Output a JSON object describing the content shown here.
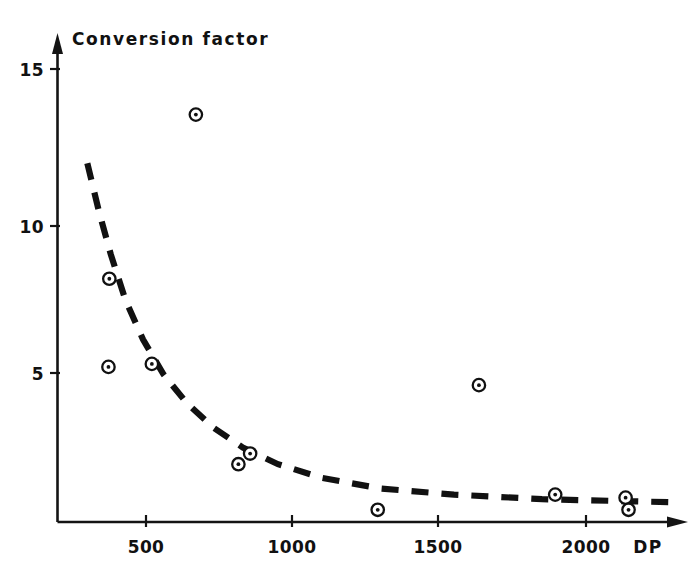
{
  "chart_data": {
    "type": "scatter",
    "title": "Conversion  factor",
    "xlabel": "DP",
    "ylabel": "Conversion factor",
    "xlim": [
      195,
      2290
    ],
    "ylim": [
      0,
      16.2
    ],
    "grid": false,
    "legend": null,
    "xticks": [
      500,
      1000,
      1500,
      2000
    ],
    "xtick_labels": [
      "500",
      "1000",
      "1500",
      "2000"
    ],
    "yticks": [
      5,
      10,
      15
    ],
    "ytick_labels": [
      "5",
      "10",
      "15"
    ],
    "x": [
      375,
      372,
      520,
      670,
      815,
      855,
      1290,
      1635,
      1895,
      2135,
      2145
    ],
    "y": [
      8.1,
      5.2,
      5.3,
      13.5,
      2.0,
      2.35,
      0.5,
      4.6,
      1.0,
      0.9,
      0.5
    ],
    "points": [
      {
        "x": 375,
        "y": 8.1
      },
      {
        "x": 372,
        "y": 5.2
      },
      {
        "x": 520,
        "y": 5.3
      },
      {
        "x": 670,
        "y": 13.5
      },
      {
        "x": 815,
        "y": 2.0
      },
      {
        "x": 855,
        "y": 2.35
      },
      {
        "x": 1290,
        "y": 0.5
      },
      {
        "x": 1635,
        "y": 4.6
      },
      {
        "x": 1895,
        "y": 1.0
      },
      {
        "x": 2135,
        "y": 0.9
      },
      {
        "x": 2145,
        "y": 0.5
      }
    ],
    "series": [
      {
        "name": "conversion factor data",
        "marker": "circle-dot",
        "values": [
          8.1,
          5.2,
          5.3,
          13.5,
          2.0,
          2.35,
          0.5,
          4.6,
          1.0,
          0.9,
          0.5
        ]
      },
      {
        "name": "fitted trend curve",
        "style": "dashed",
        "curve_x": [
          300,
          340,
          380,
          430,
          490,
          560,
          640,
          730,
          830,
          950,
          1100,
          1300,
          1550,
          1850,
          2150,
          2290
        ],
        "curve_y": [
          11.9,
          10.3,
          8.9,
          7.4,
          6.1,
          4.95,
          4.0,
          3.2,
          2.55,
          2.0,
          1.55,
          1.2,
          1.0,
          0.85,
          0.78,
          0.75
        ]
      }
    ],
    "annotations": [
      {
        "text": "Conversion  factor",
        "role": "axis-title-top-left"
      },
      {
        "text": "DP",
        "role": "x-axis-label-right"
      }
    ]
  },
  "axes": {
    "x_axis_name": "DP",
    "y_axis_name": "Conversion  factor",
    "arrow_x": true,
    "arrow_y": true
  },
  "colors": {
    "ink": "#111111",
    "background": "#ffffff",
    "marker_fill": "#ffffff",
    "marker_edge": "#111111"
  }
}
